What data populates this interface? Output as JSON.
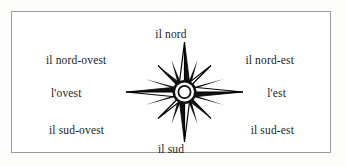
{
  "diagram": {
    "language": "Italian",
    "background_color": "#ffffff",
    "frame_color": "#9b9b9b",
    "text_color": "#1c1c1c",
    "star_fill": "#111111",
    "star_outline": "#000000",
    "center_ring_fill": "#ffffff"
  },
  "labels": {
    "north": "il nord",
    "northwest": "il nord-ovest",
    "northeast": "il nord-est",
    "west": "l'ovest",
    "east": "l'est",
    "southwest": "il sud-ovest",
    "southeast": "il sud-est",
    "south": "il sud"
  },
  "compass": {
    "name": "compass-rose",
    "points": 8,
    "long_points": [
      "north",
      "east",
      "south",
      "west"
    ],
    "short_points": [
      "northeast",
      "southeast",
      "southwest",
      "northwest"
    ],
    "center": "ring"
  }
}
